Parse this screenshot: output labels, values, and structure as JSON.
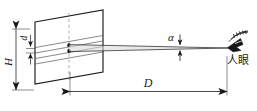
{
  "figure": {
    "type": "optical-visual-acuity-diagram",
    "background_color": "#ffffff",
    "line_color": "#1a1a1a",
    "thin_line_color": "#4a4a4a",
    "dashed_color": "#8a8a8a"
  },
  "labels": {
    "height_symbol": "H",
    "spacing_symbol": "d",
    "angle_symbol": "α",
    "distance_symbol": "D",
    "eye_text": "人眼"
  },
  "elements": {
    "target_plate_name": "target-plate",
    "centerline_name": "plate-centerline",
    "grating_lines_count": 4,
    "sight_wedge_name": "sight-line-wedge",
    "eye_icon_name": "human-eye-icon"
  },
  "dimensions": {
    "H_extent_label": "H",
    "d_extent_label": "d",
    "D_extent_label": "D",
    "alpha_extent_label": "α"
  }
}
